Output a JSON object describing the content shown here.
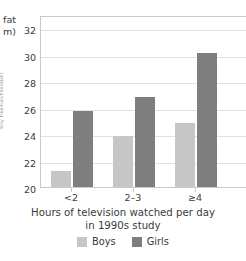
{
  "photo_credit": "Tony Freeman/PhotoEdit",
  "axis": {
    "y_title_lines": [
      "fat",
      "m)"
    ],
    "x_title_lines": [
      "Hours of television watched per day",
      "in 1990s study"
    ]
  },
  "legend": {
    "items": [
      {
        "label": "Boys",
        "color": "#c6c6c6",
        "swatch_name": "legend-swatch-boys"
      },
      {
        "label": "Girls",
        "color": "#7e7e7e",
        "swatch_name": "legend-swatch-girls"
      }
    ]
  },
  "chart_data": {
    "type": "bar",
    "title": "",
    "subtitle": "",
    "xlabel": "Hours of television watched per day in 1990s study",
    "ylabel": "fat (mm)",
    "categories": [
      "<2",
      "2–3",
      "≥4"
    ],
    "series": [
      {
        "name": "Boys",
        "color": "#c6c6c6",
        "values": [
          21.2,
          23.8,
          24.8
        ]
      },
      {
        "name": "Girls",
        "color": "#7e7e7e",
        "values": [
          25.7,
          26.8,
          30.1
        ]
      }
    ],
    "ylim": [
      20,
      33
    ],
    "yticks": [
      20,
      22,
      24,
      26,
      28,
      30,
      32
    ],
    "grid": true,
    "legend_position": "bottom-center",
    "annotations": []
  }
}
